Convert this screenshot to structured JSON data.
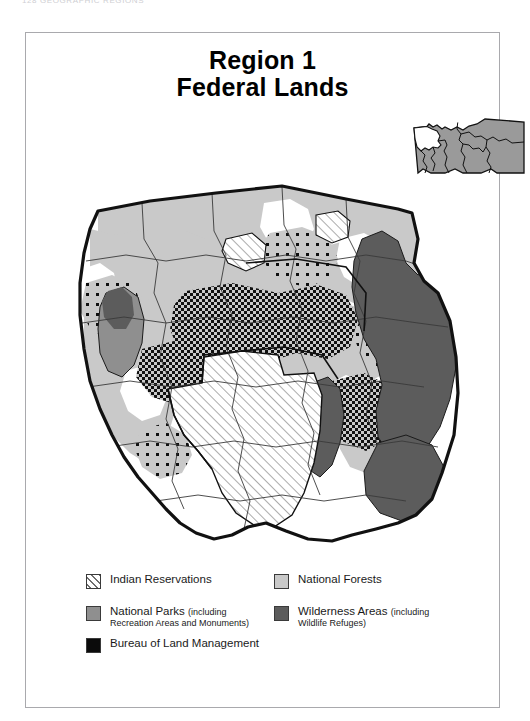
{
  "page": {
    "running_header": "128   GEOGRAPHIC REGIONS",
    "frame_border_color": "#a9a9ad",
    "background": "#ffffff"
  },
  "map": {
    "title_line_1": "Region 1",
    "title_line_2": "Federal Lands",
    "inset_label": "montana-locator-inset",
    "inset_state_fill": "#9a9a9a",
    "inset_highlight_fill": "#ffffff"
  },
  "legend": {
    "title": "",
    "left_column": [
      {
        "key": "indian-reservations",
        "swatch": "hatch",
        "label": "Indian Reservations",
        "sub": ""
      },
      {
        "key": "national-parks",
        "swatch": "#8f8f8f",
        "label": "National Parks",
        "paren": "(including",
        "sub": "Recreation Areas and Monuments)"
      },
      {
        "key": "bureau-of-land-management",
        "swatch": "#0b0b0b",
        "label": "Bureau of Land Management",
        "sub": ""
      }
    ],
    "right_column": [
      {
        "key": "national-forests",
        "swatch": "#c9c9c9",
        "label": "National Forests",
        "sub": ""
      },
      {
        "key": "wilderness-areas",
        "swatch": "#5c5c5c",
        "label": "Wilderness Areas",
        "paren": "(including",
        "sub": "Wildlife Refuges)"
      }
    ]
  },
  "colors": {
    "national_forest": "#c9c9c9",
    "national_park": "#8f8f8f",
    "wilderness": "#5c5c5c",
    "blm": "#0b0b0b",
    "reservation_hatch_line": "#6e6e6e",
    "outline": "#111111",
    "county_line": "#444444"
  }
}
